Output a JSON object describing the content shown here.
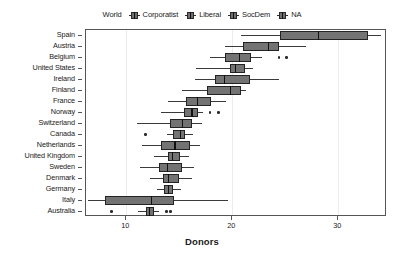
{
  "chart_data": {
    "type": "box",
    "title": "",
    "xlabel": "Donors",
    "ylabel": "",
    "xlim": [
      6.2,
      34.6
    ],
    "xticks": [
      10,
      20,
      30
    ],
    "xtick_labels": [
      "10",
      "20",
      "30"
    ],
    "grid": "vertical-light",
    "legend": {
      "position": "top-center",
      "entries": [
        {
          "label": "World",
          "glyph": "none"
        },
        {
          "label": "Corporatist",
          "glyph": "box"
        },
        {
          "label": "Liberal",
          "glyph": "box"
        },
        {
          "label": "SocDem",
          "glyph": "box"
        },
        {
          "label": "NA",
          "glyph": "box"
        }
      ]
    },
    "categories": [
      "Spain",
      "Austria",
      "Belgium",
      "United States",
      "Ireland",
      "Finland",
      "France",
      "Norway",
      "Switzerland",
      "Canada",
      "Netherlands",
      "United Kingdom",
      "Sweden",
      "Denmark",
      "Germany",
      "Italy",
      "Australia"
    ],
    "boxes": [
      {
        "category": "Spain",
        "min": 20.8,
        "q1": 24.5,
        "median": 28.1,
        "q3": 32.8,
        "max": 34.0,
        "outliers": []
      },
      {
        "category": "Austria",
        "min": 19.3,
        "q1": 21.0,
        "median": 23.4,
        "q3": 24.4,
        "max": 27.0,
        "outliers": []
      },
      {
        "category": "Belgium",
        "min": 17.9,
        "q1": 19.3,
        "median": 20.7,
        "q3": 21.8,
        "max": 22.8,
        "outliers": [
          24.4,
          25.1
        ]
      },
      {
        "category": "United States",
        "min": 16.6,
        "q1": 19.8,
        "median": 20.3,
        "q3": 21.2,
        "max": 22.0,
        "outliers": []
      },
      {
        "category": "Ireland",
        "min": 16.5,
        "q1": 18.4,
        "median": 19.3,
        "q3": 21.7,
        "max": 24.4,
        "outliers": []
      },
      {
        "category": "Finland",
        "min": 15.3,
        "q1": 17.6,
        "median": 19.8,
        "q3": 20.8,
        "max": 21.3,
        "outliers": []
      },
      {
        "category": "France",
        "min": 13.9,
        "q1": 15.6,
        "median": 16.7,
        "q3": 18.0,
        "max": 19.4,
        "outliers": []
      },
      {
        "category": "Norway",
        "min": 13.3,
        "q1": 15.4,
        "median": 16.2,
        "q3": 16.8,
        "max": 17.2,
        "outliers": [
          17.9,
          18.7
        ]
      },
      {
        "category": "Switzerland",
        "min": 11.0,
        "q1": 14.1,
        "median": 15.3,
        "q3": 16.2,
        "max": 17.1,
        "outliers": []
      },
      {
        "category": "Canada",
        "min": 13.8,
        "q1": 14.4,
        "median": 15.1,
        "q3": 15.5,
        "max": 16.3,
        "outliers": [
          11.8
        ]
      },
      {
        "category": "Netherlands",
        "min": 11.5,
        "q1": 13.3,
        "median": 14.6,
        "q3": 16.0,
        "max": 17.0,
        "outliers": []
      },
      {
        "category": "United Kingdom",
        "min": 12.6,
        "q1": 13.9,
        "median": 14.4,
        "q3": 15.1,
        "max": 15.9,
        "outliers": []
      },
      {
        "category": "Sweden",
        "min": 11.3,
        "q1": 13.1,
        "median": 13.9,
        "q3": 15.3,
        "max": 16.4,
        "outliers": []
      },
      {
        "category": "Denmark",
        "min": 12.2,
        "q1": 13.5,
        "median": 14.0,
        "q3": 15.0,
        "max": 16.2,
        "outliers": []
      },
      {
        "category": "Germany",
        "min": 12.9,
        "q1": 13.6,
        "median": 14.0,
        "q3": 14.4,
        "max": 15.2,
        "outliers": []
      },
      {
        "category": "Italy",
        "min": 6.4,
        "q1": 8.0,
        "median": 12.4,
        "q3": 14.5,
        "max": 19.6,
        "outliers": []
      },
      {
        "category": "Australia",
        "min": 11.1,
        "q1": 11.9,
        "median": 12.2,
        "q3": 12.6,
        "max": 13.1,
        "outliers": [
          8.6,
          13.8,
          14.2
        ]
      }
    ],
    "colors": {
      "box_fill": "#737373",
      "box_border": "#232323",
      "median": "#111111",
      "whisker": "#3a3a3a",
      "grid": "#ececec",
      "panel_border": "#555555",
      "background": "#ffffff"
    }
  }
}
